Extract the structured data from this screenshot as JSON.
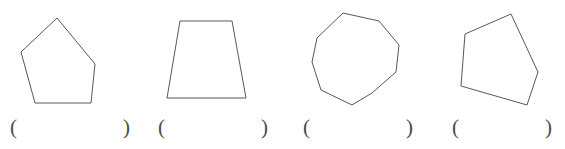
{
  "page": {
    "background_color": "#ffffff",
    "width": 565,
    "height": 149
  },
  "style": {
    "stroke_color": "#585858",
    "stroke_width": 1,
    "text_color": "#4a4a4a"
  },
  "shapes": [
    {
      "name": "pentagon-upright",
      "sides": 5,
      "label": "pentagon",
      "points": "57,18 21,52 35,103 91,103 95,64"
    },
    {
      "name": "trapezoid",
      "sides": 4,
      "label": "trapezoid",
      "points": "180,21 232,21 246,98 167,98"
    },
    {
      "name": "nonagon",
      "sides": 9,
      "label": "nonagon",
      "points": "343,13 379,21 399,45 396,72 372,93 352,105 321,90 312,62 317,38"
    },
    {
      "name": "pentagon-rotated",
      "sides": 5,
      "label": "pentagon",
      "points": "511,14 465,34 461,86 527,105 538,72"
    }
  ],
  "answers": [
    {
      "name": "answer-blank-1",
      "open": "(",
      "close": ")",
      "value": ""
    },
    {
      "name": "answer-blank-2",
      "open": "(",
      "close": ")",
      "value": ""
    },
    {
      "name": "answer-blank-3",
      "open": "(",
      "close": ")",
      "value": ""
    },
    {
      "name": "answer-blank-4",
      "open": "(",
      "close": ")",
      "value": ""
    }
  ],
  "answer_positions": [
    {
      "left": 10,
      "width": 120
    },
    {
      "left": 158,
      "width": 110
    },
    {
      "left": 303,
      "width": 110
    },
    {
      "left": 452,
      "width": 100
    }
  ]
}
